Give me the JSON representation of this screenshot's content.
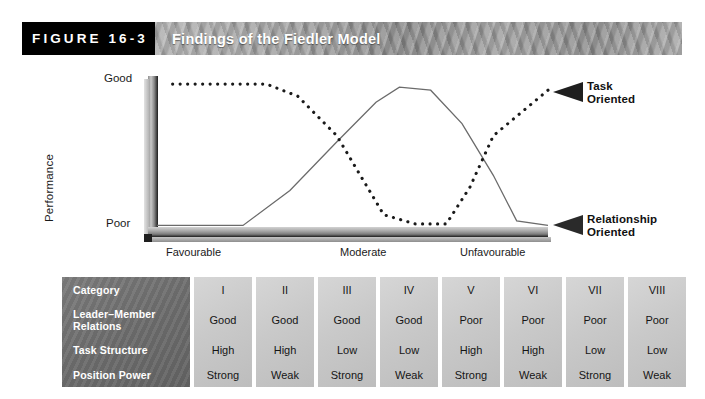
{
  "header": {
    "figure_tag": "FIGURE 16-3",
    "title": "Findings of the Fiedler Model"
  },
  "chart_data": {
    "type": "line",
    "title": "Findings of the Fiedler Model",
    "ylabel": "Performance",
    "xlabel": "",
    "y_ticks": [
      "Good",
      "Poor"
    ],
    "x_ticks": [
      "Favourable",
      "Moderate",
      "Unfavourable"
    ],
    "ylim": [
      0,
      100
    ],
    "xlim": [
      0,
      100
    ],
    "grid": false,
    "legend_position": "right",
    "series": [
      {
        "name": "Task Oriented",
        "style": "dotted",
        "color": "#1a1a1a",
        "x": [
          4,
          28,
          36,
          46,
          52,
          58,
          66,
          74,
          80,
          86,
          100
        ],
        "y": [
          96,
          96,
          88,
          62,
          36,
          10,
          4,
          4,
          28,
          62,
          92
        ]
      },
      {
        "name": "Relationship Oriented",
        "style": "solid",
        "color": "#6b6b6b",
        "x": [
          0,
          22,
          34,
          46,
          56,
          62,
          70,
          78,
          86,
          92,
          100
        ],
        "y": [
          3,
          3,
          26,
          58,
          84,
          94,
          92,
          70,
          36,
          6,
          3
        ]
      }
    ],
    "annotations": [
      {
        "label": "Task Oriented",
        "marker": "left-triangle-dark",
        "position": "top-right"
      },
      {
        "label": "Relationship Oriented",
        "marker": "left-triangle-dark",
        "position": "bottom-right"
      }
    ]
  },
  "legend": {
    "task_line1": "Task",
    "task_line2": "Oriented",
    "relationship_line1": "Relationship",
    "relationship_line2": "Oriented"
  },
  "table": {
    "row_labels": [
      "Category",
      "Leader–Member Relations",
      "Task Structure",
      "Position Power"
    ],
    "columns": [
      {
        "category": "I",
        "relations": "Good",
        "structure": "High",
        "power": "Strong"
      },
      {
        "category": "II",
        "relations": "Good",
        "structure": "High",
        "power": "Weak"
      },
      {
        "category": "III",
        "relations": "Good",
        "structure": "Low",
        "power": "Strong"
      },
      {
        "category": "IV",
        "relations": "Good",
        "structure": "Low",
        "power": "Weak"
      },
      {
        "category": "V",
        "relations": "Poor",
        "structure": "High",
        "power": "Strong"
      },
      {
        "category": "VI",
        "relations": "Poor",
        "structure": "High",
        "power": "Weak"
      },
      {
        "category": "VII",
        "relations": "Poor",
        "structure": "Low",
        "power": "Strong"
      },
      {
        "category": "VIII",
        "relations": "Poor",
        "structure": "Low",
        "power": "Weak"
      }
    ]
  },
  "colors": {
    "tag_background": "#000000",
    "banner_text": "#ffffff",
    "label_column": "#6e6e6e",
    "data_column": "#c9c9c9",
    "task_line": "#1a1a1a",
    "relationship_line": "#6b6b6b"
  }
}
